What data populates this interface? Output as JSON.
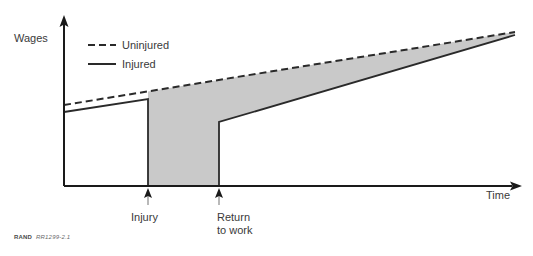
{
  "figure": {
    "source_note_prefix": "RAND",
    "source_note_id": "RR1299-2.1"
  },
  "chart_data": {
    "type": "line",
    "title": "",
    "xlabel": "Time",
    "ylabel": "Wages",
    "grid": false,
    "legend_position": "top-left",
    "axes": {
      "x_axis_arrow": true,
      "y_axis_arrow": true,
      "x_ticks_labeled": [
        "Injury",
        "Return to work"
      ],
      "y_ticks_labeled": []
    },
    "annotations": [
      {
        "label": "Injury",
        "x": 148,
        "type": "event-marker"
      },
      {
        "label": "Return\nto work",
        "x": 219,
        "type": "event-marker"
      }
    ],
    "series": [
      {
        "name": "Uninjured",
        "style": "dashed",
        "color": "#2a2a2a",
        "points": [
          {
            "x": 64,
            "y": 105
          },
          {
            "x": 515,
            "y": 32
          }
        ],
        "description": "Steadily rising wage path with no interruption"
      },
      {
        "name": "Injured",
        "style": "solid",
        "color": "#2a2a2a",
        "points": [
          {
            "x": 64,
            "y": 112
          },
          {
            "x": 148,
            "y": 99
          },
          {
            "x": 148,
            "y": 186
          },
          {
            "x": 219,
            "y": 186
          },
          {
            "x": 219,
            "y": 122
          },
          {
            "x": 515,
            "y": 35
          }
        ],
        "description": "Wages drop to zero at injury, remain zero until return to work, then recover gradually toward the uninjured path"
      }
    ],
    "shaded_region": {
      "label": "Wage loss",
      "color": "#c9c9c9",
      "description": "Area between the uninjured and injured wage paths from injury onward"
    }
  },
  "legend": {
    "items": [
      {
        "label": "Uninjured",
        "style": "dashed"
      },
      {
        "label": "Injured",
        "style": "solid"
      }
    ]
  }
}
